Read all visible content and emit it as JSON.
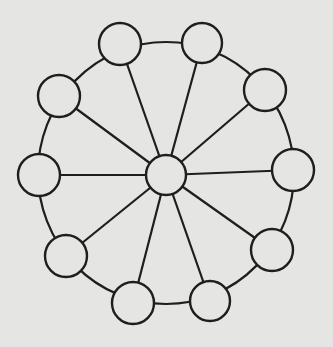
{
  "diagram": {
    "type": "wheel-network",
    "colors": {
      "background": "#e5e5e3",
      "stroke": "#1e1e1e",
      "node_fill": "#e5e5e3"
    },
    "hub": {
      "id": "hub",
      "cx": 166,
      "cy": 175,
      "r": 20
    },
    "ring": {
      "cx": 166,
      "cy": 173,
      "rx": 128,
      "ry": 131
    },
    "nodes": [
      {
        "id": "n1",
        "cx": 120,
        "cy": 44,
        "r": 21
      },
      {
        "id": "n2",
        "cx": 202,
        "cy": 43,
        "r": 20
      },
      {
        "id": "n3",
        "cx": 265,
        "cy": 90,
        "r": 21
      },
      {
        "id": "n4",
        "cx": 293,
        "cy": 170,
        "r": 21
      },
      {
        "id": "n5",
        "cx": 272,
        "cy": 250,
        "r": 21
      },
      {
        "id": "n6",
        "cx": 210,
        "cy": 301,
        "r": 20
      },
      {
        "id": "n7",
        "cx": 133,
        "cy": 303,
        "r": 21
      },
      {
        "id": "n8",
        "cx": 66,
        "cy": 256,
        "r": 21
      },
      {
        "id": "n9",
        "cx": 39,
        "cy": 175,
        "r": 21
      },
      {
        "id": "n10",
        "cx": 59,
        "cy": 96,
        "r": 21
      }
    ]
  }
}
